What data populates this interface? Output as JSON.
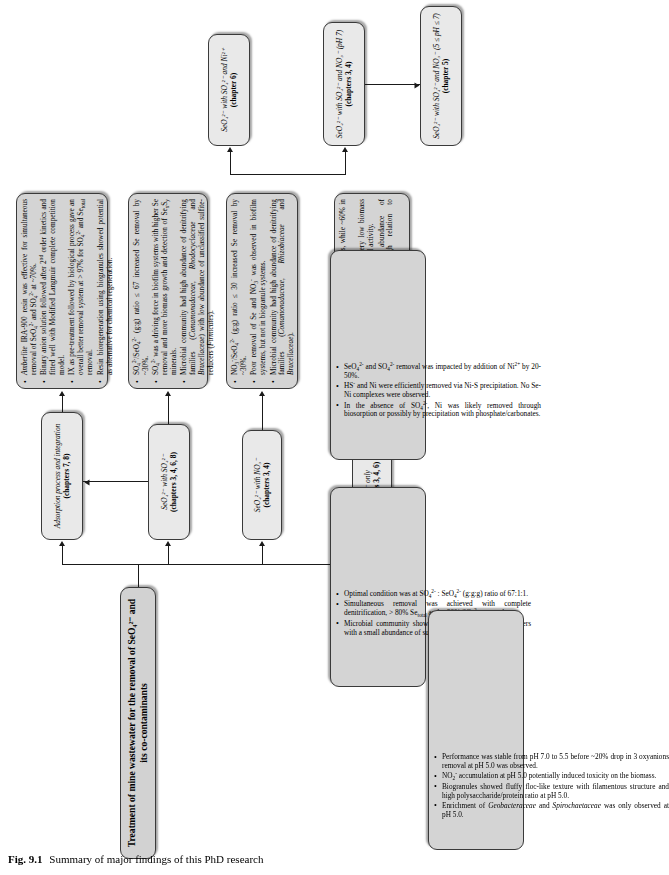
{
  "figure": {
    "number": "Fig. 9.1",
    "caption": "Summary of major findings of this PhD research"
  },
  "title_node": {
    "label": "Treatment of mine wastewater for the removal of SeO₄²⁻ and its co-contaminants"
  },
  "stages": [
    {
      "id": "stage-seo4-only",
      "line1": "SeO₄²⁻ only",
      "line2": "(chapters 3, 4, 6)"
    },
    {
      "id": "stage-seo4-no3",
      "line1": "SeO₄²⁻ with NO₃⁻",
      "line2": "(chapters 3, 4)"
    },
    {
      "id": "stage-seo4-so4",
      "line1": "SeO₄²⁻ with SO₄²⁻",
      "line2": "(chapters 3, 4, 6, 8)"
    },
    {
      "id": "stage-adsorption",
      "line1": "Adsorption process and integration",
      "line2": "(chapters 7, 8)"
    },
    {
      "id": "stage-seo4-so4-ni",
      "line1": "SeO₄²⁻ with SO₄²⁻ and Ni²⁺",
      "line2": "(chapter 6)"
    },
    {
      "id": "stage-seo4-so4-no3-ph7",
      "line1": "SeO₄²⁻ with SO₄²⁻ and NO₃⁻ (pH 7)",
      "line2": "(chapters 3, 4)"
    },
    {
      "id": "stage-seo4-so4-no3-ph5",
      "line1": "SeO₄²⁻ with SO₄²⁻ and NO₃⁻ (5 ≤ pH ≤ 7)",
      "line2": "(chapter 5)"
    }
  ],
  "findings": {
    "seo4_only": [
      "Se removal was < 30% in biofilm systems, while ~60% in biogranules systems.",
      "Biofilms were thin and compact with very low biomass weight strongly indicating Se antimicrobial activity.",
      "Microbial community had high abundance of Proteobacteria denitrifiers with high relation to Pseudomonas sp. genus."
    ],
    "seo4_no3": [
      "NO₃⁻/SeO₄²⁻ (g:g) ratio ≤ 30 increased Se removal by ~30%.",
      "Poor removal of Se and NO₃⁻ was observed in biofilm systems, but not in biogranule systems.",
      "Microbial community had high abundance of denitrifying families (Comamonadaceae, Rhizobiaceae and Brucellaceae)."
    ],
    "seo4_so4": [
      "SO₄²⁻/SeO₄²⁻ (g:g) ratio ≤ 67 increased Se removal by ~30%.",
      "SO₄²⁻ was a driving force in biofilm systems with higher Se removal and more biomass growth and detection of SeₓSᵧ minerals.",
      "Microbial community had high abundance of denitrifying families (Comamonadaceae, Rhodocyclaceae and Brucellaceae) with low abundance of unclassified sulfite-reducers (Firmicutes)."
    ],
    "adsorption": [
      "Amberlite IRA-900 resin was effective for simultaneous removal of SeO₄²⁻ and SO₄²⁻ at ~70%.",
      "Binary anion solution followed after 2ⁿᵈ order kinetics and fitted well with Modified Langmuir complete competition model.",
      "IX as pre-treatment followed by biological process gave an overall better removal system at > 97% for SO₄²⁻ and Seₜₒₜₐₗ removal.",
      "Resin bioregeneration using biogranules showed potential as alternative for chemical regeneration."
    ],
    "seo4_so4_ni": [
      "SeO₄²⁻ and SO₄²⁻ removal was impacted by addition of Ni²⁺ by 20-50%.",
      "HS⁻ and Ni were efficiently removed via Ni-S precipitation. No Se-Ni complexes were observed.",
      "In the absence of SO₄²⁻, Ni was likely removed through biosorption or possibly by precipitation with phosphate/carbonates."
    ],
    "seo4_so4_no3_ph7": [
      "Optimal condition was at SO₄²⁻ : SeO₄²⁻ (g:g:g) ratio of 67:1₂¹.",
      "Simultaneous removal was achieved with complete denitrification, > 80% Seₜₒₜₐₗ and < 30% SO₄²⁻ removal.",
      "Microbial community showed high abundance of denitrifiers with a small abundance of sulfite-reducers."
    ],
    "seo4_so4_no3_ph5": [
      "Performance was stable from pH 7.0 to 5.5 before ~20% drop in 3 enzymatic removal at pH 5.0 was observed.",
      "NO₂⁻ accumulation at pH 5.0 potentially induced toxicity on the biomass.",
      "Biogranules showed fluffy floc-like texture with filamentous structure and high polysaccharide/protein ratio at pH 5.0.",
      "Enrichment of Geobacteraceae and Spirochaetaceae was only observed at pH 5.0."
    ]
  }
}
